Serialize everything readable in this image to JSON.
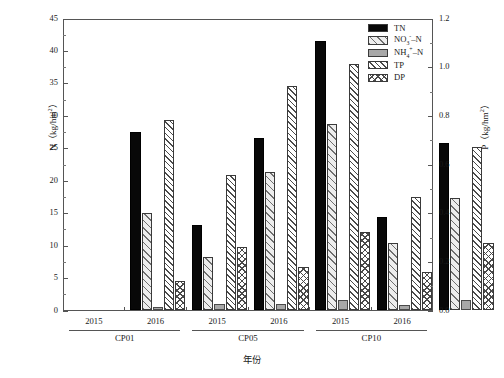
{
  "chart_data": {
    "type": "bar",
    "title": "",
    "xlabel": "年份",
    "ylabel": "N（kg/hm²）",
    "ylabel_right": "P（kg/hm²）",
    "ylim": [
      0,
      45
    ],
    "ylim_right": [
      0,
      1.2
    ],
    "ytick_labels": [
      "0",
      "5",
      "10",
      "15",
      "20",
      "25",
      "30",
      "35",
      "40",
      "45"
    ],
    "ytick_values": [
      0,
      5,
      10,
      15,
      20,
      25,
      30,
      35,
      40,
      45
    ],
    "ytick_labels_right": [
      "0.0",
      "0.2",
      "0.4",
      "0.6",
      "0.8",
      "1.0",
      "1.2"
    ],
    "ytick_values_right": [
      0,
      0.2,
      0.4,
      0.6,
      0.8,
      1.0,
      1.2
    ],
    "minor_ticks": true,
    "grid": false,
    "legend_position": "top-right",
    "categories": [
      "2015",
      "2016",
      "2015",
      "2016",
      "2015",
      "2016"
    ],
    "groups": [
      {
        "name": "CP01",
        "years": [
          "2015",
          "2016"
        ]
      },
      {
        "name": "CP05",
        "years": [
          "2015",
          "2016"
        ]
      },
      {
        "name": "CP10",
        "years": [
          "2015",
          "2016"
        ]
      }
    ],
    "series": [
      {
        "name": "TN",
        "axis": "left",
        "values": [
          27.5,
          13.1,
          26.5,
          41.4,
          14.4,
          25.8
        ]
      },
      {
        "name": "NO₃⁻–N",
        "axis": "left",
        "values": [
          14.9,
          8.1,
          21.3,
          28.6,
          10.4,
          17.2
        ]
      },
      {
        "name": "NH₄⁺–N",
        "axis": "left",
        "values": [
          0.5,
          0.9,
          0.9,
          1.5,
          0.8,
          1.5
        ]
      },
      {
        "name": "TP",
        "axis": "right",
        "values": [
          0.78,
          0.555,
          0.92,
          1.01,
          0.465,
          0.67
        ]
      },
      {
        "name": "DP",
        "axis": "right",
        "values": [
          0.12,
          0.26,
          0.175,
          0.32,
          0.155,
          0.275
        ]
      }
    ]
  },
  "legend": {
    "items": [
      {
        "label": "TN",
        "style": "solid-black",
        "color": "#080808"
      },
      {
        "label_html": "NO<sub>3</sub><sup>-</sup>–N",
        "style": "light-hatch",
        "color": "#ededed"
      },
      {
        "label_html": "NH<sub>4</sub><sup>+</sup>–N",
        "style": "solid-gray",
        "color": "#a8a8a8"
      },
      {
        "label": "TP",
        "style": "dense-hatch",
        "color": "#ffffff"
      },
      {
        "label": "DP",
        "style": "cross-hatch",
        "color": "#ffffff"
      }
    ]
  },
  "axes": {
    "left_title": "N（kg/hm²）",
    "right_title": "P（kg/hm²）",
    "x_title": "年份"
  },
  "caption": ""
}
